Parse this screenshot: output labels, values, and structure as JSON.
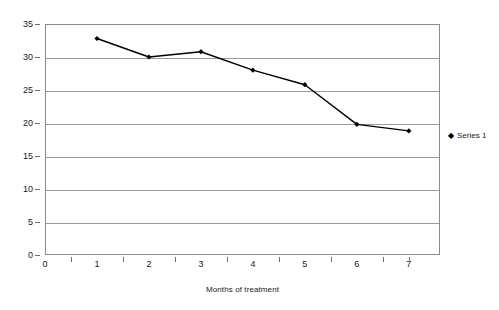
{
  "chart_data": {
    "type": "line",
    "title": "",
    "xlabel": "Months of treatment",
    "ylabel": "Mean depression scores",
    "x": [
      1,
      2,
      3,
      4,
      5,
      6,
      7
    ],
    "categories": [
      "1",
      "2",
      "3",
      "4",
      "5",
      "6",
      "7"
    ],
    "series": [
      {
        "name": "Series 1",
        "marker": "diamond",
        "color": "#000000",
        "values": [
          32.8,
          30.0,
          30.8,
          28.0,
          25.8,
          19.8,
          18.8
        ]
      }
    ],
    "xlim": [
      0,
      7.6
    ],
    "ylim": [
      0,
      35
    ],
    "x_ticks": [
      0,
      1,
      2,
      3,
      4,
      5,
      6,
      7
    ],
    "x_tick_labels": [
      "0",
      "1",
      "2",
      "3",
      "4",
      "5",
      "6",
      "7"
    ],
    "y_ticks": [
      0,
      5,
      10,
      15,
      20,
      25,
      30,
      35
    ],
    "y_tick_labels": [
      "0",
      "5",
      "10",
      "15",
      "20",
      "25",
      "30",
      "35"
    ],
    "grid": "horizontal",
    "grid_color": "#9a9a9a",
    "frame_color": "#8c8c8c",
    "legend_position": "right"
  },
  "legend": {
    "marker_glyph": "◆",
    "entries": [
      {
        "label": "Series 1"
      }
    ]
  }
}
